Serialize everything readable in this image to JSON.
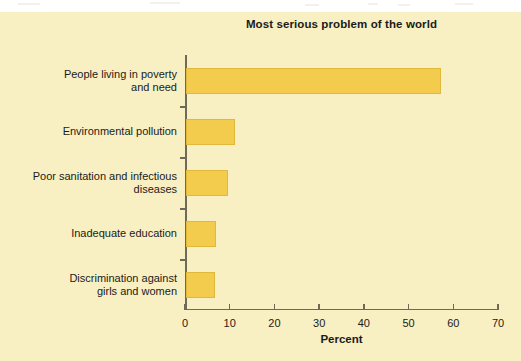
{
  "chart_data": {
    "type": "bar",
    "orientation": "horizontal",
    "title": "Most serious problem of the world",
    "xlabel": "Percent",
    "ylabel": "",
    "categories": [
      "People living in poverty\nand need",
      "Environmental pollution",
      "Poor sanitation and infectious\ndiseases",
      "Inadequate education",
      "Discrimination against\ngirls and women"
    ],
    "values": [
      57,
      11,
      9.5,
      6.8,
      6.5
    ],
    "xlim": [
      0,
      70
    ],
    "xticks": [
      0,
      10,
      20,
      30,
      40,
      50,
      60,
      70
    ],
    "xtick_labels": [
      "0",
      "10",
      "20",
      "30",
      "40",
      "50",
      "60",
      "70"
    ],
    "grid": false,
    "legend": false,
    "bar_color": "#f3cb4d",
    "bar_border_color": "#e0b93c",
    "panel_color": "#f8efc2",
    "axis_color": "#6e6a58",
    "text_color": "#1b1b1b"
  }
}
